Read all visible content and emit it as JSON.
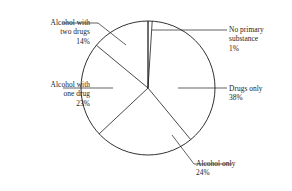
{
  "chart_data": {
    "type": "pie",
    "title": "",
    "subtitle": "",
    "xlabel": "",
    "ylabel": "",
    "legend_position": "none",
    "grid": false,
    "style": {
      "fill": "#ffffff",
      "stroke": "#1c1c1c",
      "background": "#ffffff",
      "rim_ticks": 100,
      "start_angle_deg": 0,
      "direction": "clockwise"
    },
    "units": "percent",
    "total": 100,
    "categories": [
      "No primary substance",
      "Drugs only",
      "Alcohol only",
      "Alcohol with one drug",
      "Alcohol with two drugs"
    ],
    "values": [
      1,
      38,
      24,
      23,
      14
    ],
    "slices": [
      {
        "label": "No primary substance",
        "label_line1": "No primary",
        "label_line2": "substance",
        "value": 1,
        "value_label": "1%",
        "side": "right"
      },
      {
        "label": "Drugs only",
        "label_line1": "Drugs only",
        "label_line2": "",
        "value": 38,
        "value_label": "38%",
        "side": "right"
      },
      {
        "label": "Alcohol only",
        "label_line1": "Alcohol only",
        "label_line2": "",
        "value": 24,
        "value_label": "24%",
        "side": "right"
      },
      {
        "label": "Alcohol with one drug",
        "label_line1": "Alcohol with",
        "label_line2": "one drug",
        "value": 23,
        "value_label": "23%",
        "side": "left"
      },
      {
        "label": "Alcohol with two drugs",
        "label_line1": "Alcohol with",
        "label_line2": "two drugs",
        "value": 14,
        "value_label": "14%",
        "side": "left"
      }
    ]
  }
}
